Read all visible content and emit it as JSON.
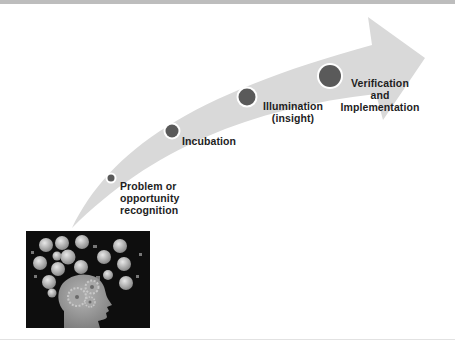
{
  "diagram": {
    "colors": {
      "arrow": "#d9d9d9",
      "node": "#5a5a5a",
      "node_ring": "#ffffff",
      "text": "#1e1e1e",
      "photo_bg": "#0e0e0e"
    },
    "stages": [
      {
        "id": "problem",
        "lines": [
          "Problem or",
          "opportunity",
          "recognition"
        ],
        "order": 1
      },
      {
        "id": "incubation",
        "lines": [
          "Incubation"
        ],
        "order": 2
      },
      {
        "id": "illumination",
        "lines": [
          "Illumination",
          "(insight)"
        ],
        "order": 3
      },
      {
        "id": "verification",
        "lines": [
          "Verification",
          "and",
          "Implementation"
        ],
        "order": 4
      }
    ],
    "illustration": {
      "description": "head silhouette with gears and idea icons",
      "icon": "creative-mind-illustration"
    }
  }
}
